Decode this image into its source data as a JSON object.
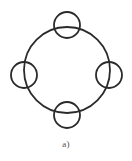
{
  "figure": {
    "caption": "a)",
    "background_color": "#ffffff",
    "stroke_color": "#2b2a2a",
    "caption_color": "#555050",
    "canvas": {
      "width": 132,
      "height": 161
    },
    "diagram_type": "ring-resonator-with-four-coupled-rings",
    "main_ring": {
      "name": "main-ring",
      "cx": 67,
      "cy": 70,
      "r": 43,
      "stroke_width": 1.8
    },
    "node_rings": [
      {
        "name": "top-ring",
        "position": "top",
        "cx": 67,
        "cy": 25,
        "r": 13,
        "stroke_width": 1.8
      },
      {
        "name": "right-ring",
        "position": "right",
        "cx": 109,
        "cy": 75,
        "r": 13,
        "stroke_width": 1.8
      },
      {
        "name": "bottom-ring",
        "position": "bottom",
        "cx": 67,
        "cy": 115,
        "r": 13,
        "stroke_width": 1.8
      },
      {
        "name": "left-ring",
        "position": "left",
        "cx": 24,
        "cy": 75,
        "r": 13,
        "stroke_width": 1.8
      }
    ]
  }
}
